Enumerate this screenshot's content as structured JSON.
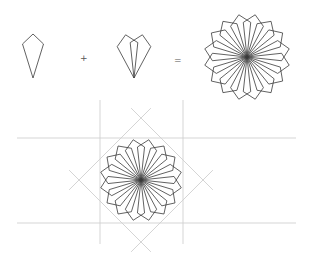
{
  "figure": {
    "title": "",
    "colors": {
      "stroke": "#3a3a3a",
      "guide": "#d0d0d0",
      "background": "#ffffff"
    },
    "equation": {
      "plus": "+",
      "equals": "=",
      "terms": [
        {
          "name": "single-kite",
          "cx": 33,
          "tip_y": 78
        },
        {
          "name": "kite-pair",
          "cx": 134,
          "tip_y": 78,
          "rotation_deg": 11
        },
        {
          "name": "rosette",
          "cx": 247,
          "cy": 57,
          "radius": 43,
          "fold": 8
        }
      ]
    },
    "construction": {
      "rosette": {
        "cx": 141,
        "cy": 180,
        "radius": 41,
        "fold": 8
      },
      "horizontal_guides": [
        {
          "y": 138,
          "x1": 17,
          "x2": 296
        },
        {
          "y": 223,
          "x1": 17,
          "x2": 296
        }
      ],
      "vertical_guides": [
        {
          "x": 100,
          "y1": 100,
          "y2": 244
        },
        {
          "x": 183,
          "y1": 100,
          "y2": 244
        }
      ],
      "diagonal_square": {
        "cx": 141,
        "cy": 180,
        "half_diagonal": 62,
        "overshoot": 14
      }
    },
    "kite_shape": {
      "length": 44,
      "shoulder": 10,
      "half_width": 10.5
    }
  }
}
